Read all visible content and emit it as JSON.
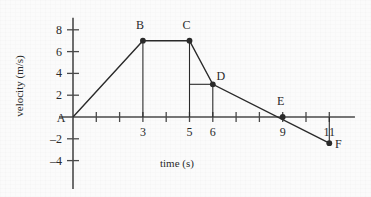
{
  "chart_data": {
    "type": "line",
    "title": "",
    "xlabel": "time (s)",
    "ylabel": "velocity (m/s)",
    "xlim": [
      -0.6,
      12.1
    ],
    "ylim": [
      -6.6,
      9.1
    ],
    "grid": false,
    "legend": null,
    "x_ticks": [
      1,
      2,
      3,
      4,
      5,
      6,
      7,
      8,
      9,
      10,
      11
    ],
    "x_tick_labels": [
      "",
      "",
      "3",
      "",
      "5",
      "6",
      "",
      "",
      "9",
      "",
      "11"
    ],
    "y_ticks": [
      -4,
      -2,
      2,
      4,
      6,
      8
    ],
    "y_tick_labels": [
      "–4",
      "–2",
      "2",
      "4",
      "6",
      "8"
    ],
    "origin_label": "A",
    "points": [
      {
        "label": "A",
        "x": 0,
        "y": 0,
        "marker": false,
        "label_dx": -12,
        "label_dy": 4
      },
      {
        "label": "B",
        "x": 3,
        "y": 7,
        "marker": true,
        "label_dx": -3,
        "label_dy": -12
      },
      {
        "label": "C",
        "x": 5,
        "y": 7,
        "marker": true,
        "label_dx": -3,
        "label_dy": -12
      },
      {
        "label": "D",
        "x": 6,
        "y": 3,
        "marker": true,
        "label_dx": 8,
        "label_dy": -4
      },
      {
        "label": "E",
        "x": 9,
        "y": 0,
        "marker": true,
        "label_dx": -2,
        "label_dy": -12
      },
      {
        "label": "F",
        "x": 11,
        "y": -2.4,
        "marker": true,
        "label_dx": 9,
        "label_dy": 5
      }
    ],
    "series": [
      {
        "name": "velocity",
        "x": [
          0,
          3,
          5,
          6,
          11
        ],
        "values": [
          0,
          7,
          7,
          3,
          -2.4
        ]
      }
    ],
    "drop_lines": [
      {
        "x": 3,
        "from_y": 7,
        "to_y": 0
      },
      {
        "x": 5,
        "from_y": 7,
        "to_y": 0
      },
      {
        "x": 6,
        "from_y": 3,
        "to_y": 0
      },
      {
        "x": 11,
        "from_y": 0,
        "to_y": -2.4
      }
    ],
    "guide_lines": [
      {
        "y": 3,
        "from_x": 5,
        "to_x": 6
      }
    ],
    "line_color": "#2a2a2a",
    "axis_color": "#4a4a4a",
    "text_color": "#2a2a2a",
    "background_color": "#fbfbfb"
  }
}
